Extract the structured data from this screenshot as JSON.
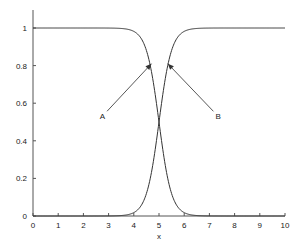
{
  "chart_data": {
    "type": "line",
    "title": "",
    "xlabel": "x",
    "ylabel": "",
    "xlim": [
      0,
      10
    ],
    "ylim": [
      0,
      1.1
    ],
    "x_ticks": [
      0,
      1,
      2,
      3,
      4,
      5,
      6,
      7,
      8,
      9,
      10
    ],
    "y_ticks": [
      0,
      0.2,
      0.4,
      0.6,
      0.8,
      1
    ],
    "y_tick_labels": [
      "0",
      "0.2",
      "0.4",
      "0.6",
      "0.8",
      "1"
    ],
    "grid": false,
    "legend": null,
    "series": [
      {
        "name": "A",
        "description": "decreasing sigmoid 1/(1+exp(4(x-5)))",
        "x": [
          0,
          1,
          2,
          3,
          3.5,
          4,
          4.25,
          4.5,
          4.75,
          5,
          5.25,
          5.5,
          5.75,
          6,
          6.5,
          7,
          8,
          9,
          10
        ],
        "values": [
          1.0,
          1.0,
          1.0,
          1.0,
          0.998,
          0.982,
          0.953,
          0.881,
          0.731,
          0.5,
          0.269,
          0.119,
          0.047,
          0.018,
          0.002,
          0.0,
          0.0,
          0.0,
          0.0
        ]
      },
      {
        "name": "B",
        "description": "increasing sigmoid 1/(1+exp(-4(x-5)))",
        "x": [
          0,
          1,
          2,
          3,
          3.5,
          4,
          4.25,
          4.5,
          4.75,
          5,
          5.25,
          5.5,
          5.75,
          6,
          6.5,
          7,
          8,
          9,
          10
        ],
        "values": [
          0.0,
          0.0,
          0.0,
          0.0,
          0.002,
          0.018,
          0.047,
          0.119,
          0.269,
          0.5,
          0.731,
          0.881,
          0.953,
          0.982,
          0.998,
          1.0,
          1.0,
          1.0,
          1.0
        ]
      }
    ],
    "annotations": [
      {
        "text": "A",
        "label_x": 2.75,
        "label_y": 0.53,
        "arrow_to_x": 4.7,
        "arrow_to_y": 0.81
      },
      {
        "text": "B",
        "label_x": 7.35,
        "label_y": 0.53,
        "arrow_to_x": 5.35,
        "arrow_to_y": 0.81
      }
    ],
    "sigmoid_steepness": 4,
    "sigmoid_center": 5
  }
}
